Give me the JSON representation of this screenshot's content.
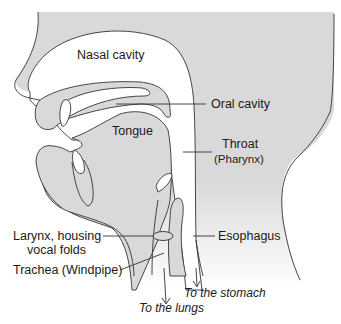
{
  "diagram": {
    "colors": {
      "tissue": "#d9d9d9",
      "cavity": "#ffffff",
      "outline": "#333333"
    },
    "labels": {
      "nasal_cavity": "Nasal cavity",
      "oral_cavity": "Oral cavity",
      "tongue": "Tongue",
      "throat_line1": "Throat",
      "throat_line2": "(Pharynx)",
      "larynx_line1": "Larynx, housing",
      "larynx_line2": "vocal folds",
      "esophagus": "Esophagus",
      "trachea": "Trachea (Windpipe)",
      "to_stomach": "To the stomach",
      "to_lungs": "To the lungs"
    }
  }
}
